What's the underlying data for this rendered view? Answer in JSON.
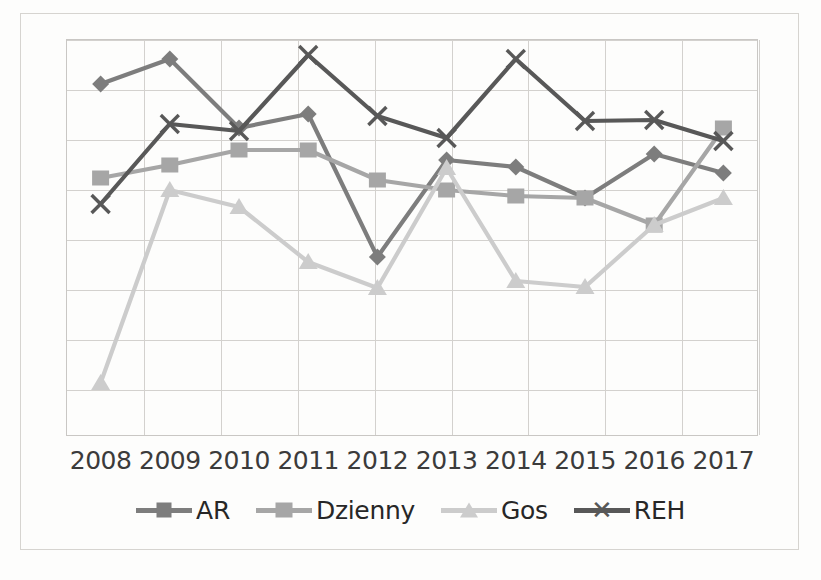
{
  "chart_data": {
    "type": "line",
    "title": "",
    "subtitle": "",
    "xlabel": "",
    "ylabel": "",
    "grid": true,
    "legend_position": "bottom",
    "axis": {
      "y_visible_ticks": false,
      "y_gridlines": 9,
      "ylim_note": "Y axis unlabeled; values are relative index positions read off gridlines (0 = bottom gridline, 8 = top gridline)"
    },
    "categories": [
      "2008",
      "2009",
      "2010",
      "2011",
      "2012",
      "2013",
      "2014",
      "2015",
      "2016",
      "2017"
    ],
    "series": [
      {
        "name": "AR",
        "marker": "diamond",
        "color": "#7d7d7d",
        "values": [
          7.12,
          7.62,
          6.24,
          6.52,
          3.66,
          5.6,
          5.46,
          4.84,
          5.72,
          5.34
        ]
      },
      {
        "name": "Dzienny",
        "marker": "square",
        "color": "#a6a6a6",
        "values": [
          5.24,
          5.5,
          5.8,
          5.8,
          5.2,
          5.0,
          4.88,
          4.84,
          4.3,
          6.24
        ]
      },
      {
        "name": "Gos",
        "marker": "triangle",
        "color": "#cccccc",
        "values": [
          1.14,
          5.0,
          4.66,
          3.56,
          3.04,
          5.44,
          3.18,
          3.06,
          4.3,
          4.84
        ]
      },
      {
        "name": "REH",
        "marker": "x",
        "color": "#585858",
        "values": [
          4.72,
          6.32,
          6.18,
          7.7,
          6.48,
          6.04,
          7.62,
          6.38,
          6.4,
          5.98
        ]
      }
    ]
  },
  "legend": {
    "items": [
      {
        "label": "AR",
        "marker": "diamond-marker",
        "color": "#7d7d7d"
      },
      {
        "label": "Dzienny",
        "marker": "square-marker",
        "color": "#a6a6a6"
      },
      {
        "label": "Gos",
        "marker": "triangle-marker",
        "color": "#cccccc"
      },
      {
        "label": "REH",
        "marker": "x-marker",
        "color": "#585858"
      }
    ]
  },
  "colors": {
    "ar": "#7d7d7d",
    "dzienny": "#a6a6a6",
    "gos": "#cccccc",
    "reh": "#585858",
    "grid": "#d3d1ce",
    "plot_border": "#c9c7c4",
    "text": "#3b3b3b",
    "background": "#fdfdfc"
  }
}
